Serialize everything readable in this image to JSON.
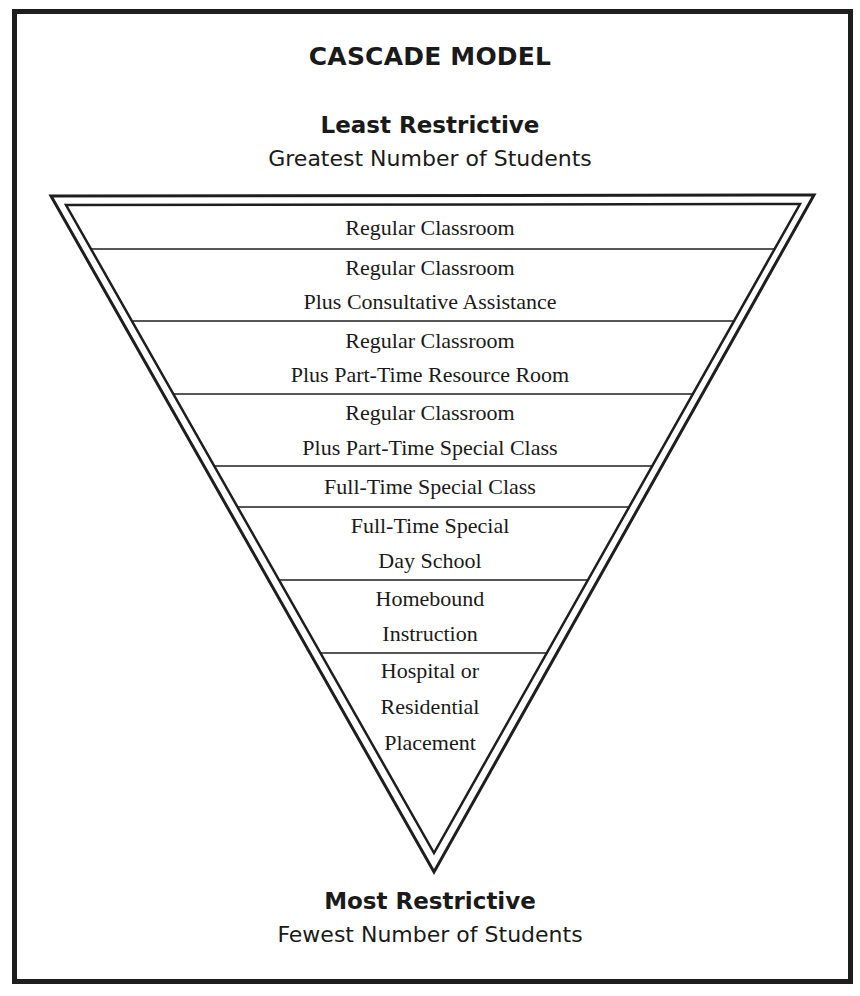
{
  "title": "CASCADE MODEL",
  "top_label": {
    "heading": "Least Restrictive",
    "subheading": "Greatest Number of Students"
  },
  "bottom_label": {
    "heading": "Most Restrictive",
    "subheading": "Fewest Number of Students"
  },
  "tiers": [
    {
      "lines": [
        "Regular Classroom"
      ]
    },
    {
      "lines": [
        "Regular Classroom",
        "Plus Consultative Assistance"
      ]
    },
    {
      "lines": [
        "Regular Classroom",
        "Plus Part-Time Resource Room"
      ]
    },
    {
      "lines": [
        "Regular Classroom",
        "Plus Part-Time Special Class"
      ]
    },
    {
      "lines": [
        "Full-Time Special Class"
      ]
    },
    {
      "lines": [
        "Full-Time Special",
        "Day School"
      ]
    },
    {
      "lines": [
        "Homebound",
        "Instruction"
      ]
    },
    {
      "lines": [
        "Hospital or",
        "Residential",
        "Placement"
      ]
    }
  ],
  "colors": {
    "line": "#1e1e1e",
    "text": "#1a1a1a",
    "background": "#ffffff"
  }
}
